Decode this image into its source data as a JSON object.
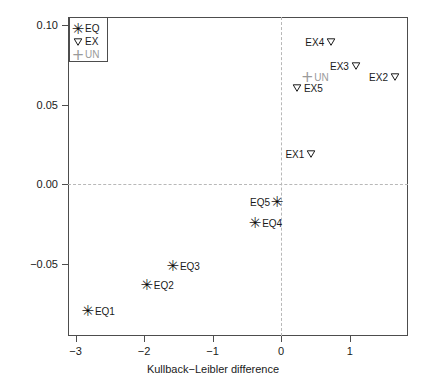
{
  "chart_data": {
    "type": "scatter",
    "title": "",
    "xlabel": "Kullback−Leibler difference",
    "ylabel": "Chernoff difference",
    "xlim": [
      -3.11,
      1.85
    ],
    "ylim": [
      -0.095,
      0.105
    ],
    "xticks": [
      -3,
      -2,
      -1,
      0,
      1
    ],
    "xtick_labels": [
      "−3",
      "−2",
      "−1",
      "0",
      "1"
    ],
    "yticks": [
      0.1,
      0.05,
      0.0,
      -0.05
    ],
    "ytick_labels": [
      "0.10",
      "0.05",
      "0.00",
      "−0.05"
    ],
    "grid": false,
    "reference_lines": {
      "hline_y": 0.0,
      "vline_x": 0.0,
      "style": "dashed",
      "color": "#b8b8b8"
    },
    "legend": {
      "position": "top-left",
      "entries": [
        {
          "label": "EQ",
          "marker": "star",
          "color": "#111111"
        },
        {
          "label": "EX",
          "marker": "triangle-down",
          "color": "#1a1a1a"
        },
        {
          "label": "UN",
          "marker": "plus",
          "color": "#9a9a9a"
        }
      ]
    },
    "series": [
      {
        "name": "EQ",
        "marker": "star",
        "color": "#111111",
        "points": [
          {
            "label": "EQ1",
            "x": -2.82,
            "y": -0.0794,
            "label_side": "right"
          },
          {
            "label": "EQ2",
            "x": -1.96,
            "y": -0.063,
            "label_side": "right"
          },
          {
            "label": "EQ3",
            "x": -1.58,
            "y": -0.0511,
            "label_side": "right"
          },
          {
            "label": "EQ4",
            "x": -0.38,
            "y": -0.024,
            "label_side": "right"
          },
          {
            "label": "EQ5",
            "x": -0.06,
            "y": -0.0113,
            "label_side": "left"
          }
        ]
      },
      {
        "name": "EX",
        "marker": "triangle-down",
        "color": "#1a1a1a",
        "points": [
          {
            "label": "EX1",
            "x": 0.44,
            "y": 0.0189,
            "label_side": "left"
          },
          {
            "label": "EX2",
            "x": 1.66,
            "y": 0.0675,
            "label_side": "left"
          },
          {
            "label": "EX3",
            "x": 1.09,
            "y": 0.0744,
            "label_side": "left"
          },
          {
            "label": "EX4",
            "x": 0.73,
            "y": 0.0895,
            "label_side": "left"
          },
          {
            "label": "EX5",
            "x": 0.23,
            "y": 0.0605,
            "label_side": "right"
          }
        ]
      },
      {
        "name": "UN",
        "marker": "plus",
        "color": "#9a9a9a",
        "points": [
          {
            "label": "UN",
            "x": 0.38,
            "y": 0.0675,
            "label_side": "right"
          }
        ]
      }
    ]
  }
}
